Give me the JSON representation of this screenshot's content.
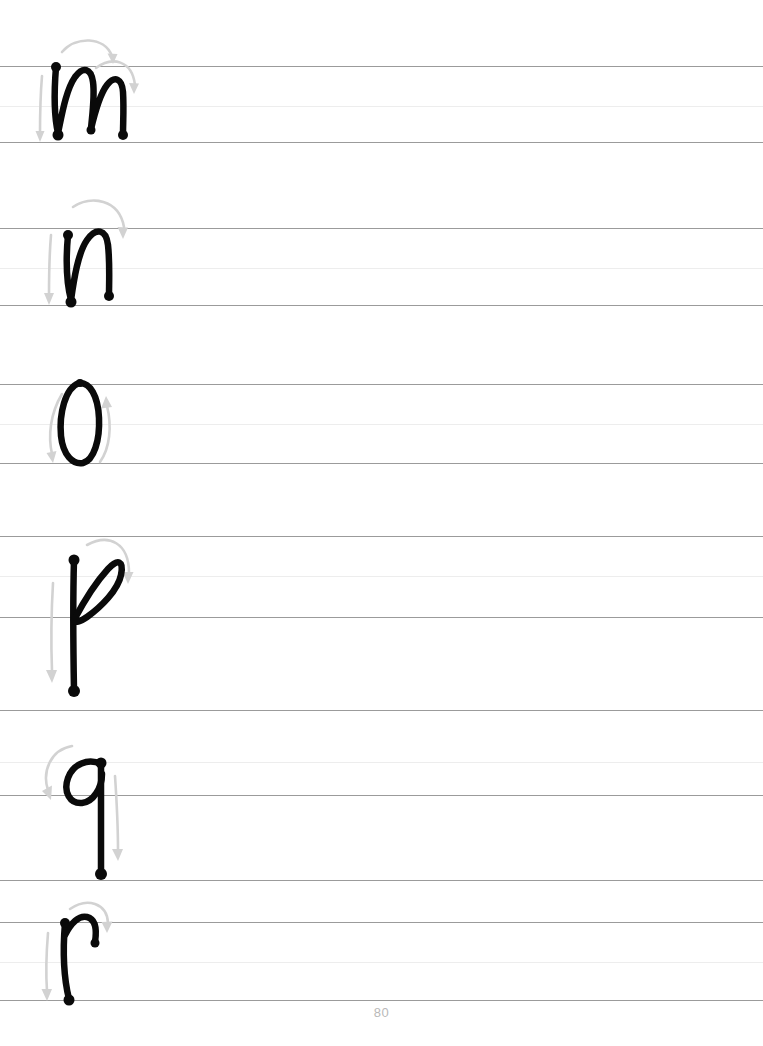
{
  "document": {
    "type": "handwriting-practice-worksheet",
    "title": "Cursive lowercase letter tracing practice",
    "page_number": "80",
    "background_color": "#ffffff"
  },
  "style": {
    "baseline_color": "#9b9b9b",
    "midline_color": "#ededed",
    "letter_stroke_color": "#0a0a0a",
    "arrow_color": "#d2d2d2",
    "page_number_color": "#b9b9b9"
  },
  "rows": [
    {
      "id": "row-m",
      "letter": "m",
      "letter_name": "lowercase-m",
      "top_line_y": 66,
      "mid_line_y": 106,
      "base_line_y": 142,
      "has_descender": false,
      "start_dots": 1,
      "end_dots": 2,
      "arrow_count": 3,
      "description": "Lowercase cursive m with two arches, start dot at x-height, two end dots on baseline"
    },
    {
      "id": "row-n",
      "letter": "n",
      "letter_name": "lowercase-n",
      "top_line_y": 228,
      "mid_line_y": 268,
      "base_line_y": 305,
      "has_descender": false,
      "start_dots": 1,
      "end_dots": 2,
      "arrow_count": 2,
      "description": "Lowercase cursive n with one arch, start dot below x-height, two end dots on baseline"
    },
    {
      "id": "row-o",
      "letter": "o",
      "letter_name": "lowercase-o",
      "top_line_y": 384,
      "mid_line_y": 424,
      "base_line_y": 463,
      "has_descender": false,
      "start_dots": 0,
      "end_dots": 0,
      "arrow_count": 2,
      "description": "Lowercase cursive o as a narrow oval traced counterclockwise"
    },
    {
      "id": "row-p",
      "letter": "p",
      "letter_name": "lowercase-p",
      "top_line_y": 536,
      "mid_line_y": 576,
      "base_line_y": 617,
      "descender_line_y": 710,
      "has_descender": true,
      "start_dots": 1,
      "end_dots": 1,
      "arrow_count": 2,
      "description": "Lowercase cursive p with angled teardrop loop and long straight descender"
    },
    {
      "id": "row-q",
      "letter": "q",
      "letter_name": "lowercase-q",
      "top_line_y": 710,
      "mid_line_y": 762,
      "base_line_y": 795,
      "descender_line_y": 880,
      "has_descender": true,
      "start_dots": 1,
      "end_dots": 1,
      "arrow_count": 2,
      "description": "Lowercase cursive q with open loop at left and straight descender"
    },
    {
      "id": "row-r",
      "letter": "r",
      "letter_name": "lowercase-r",
      "top_line_y": 922,
      "mid_line_y": 962,
      "base_line_y": 1000,
      "has_descender": false,
      "start_dots": 1,
      "end_dots": 2,
      "arrow_count": 2,
      "description": "Lowercase cursive r with short shoulder hook ending at mid-height"
    }
  ]
}
